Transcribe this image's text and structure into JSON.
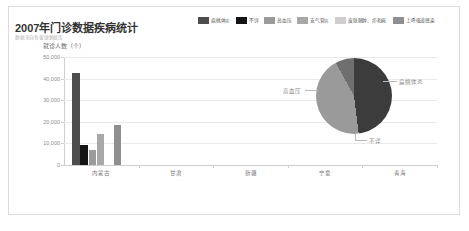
{
  "header": {
    "title": "2007年门诊数据疾病统计",
    "subtitle": "数据来自各省便数据库"
  },
  "legend": {
    "items": [
      {
        "label": "扁桃体炎",
        "color": "#4d4d4d"
      },
      {
        "label": "不详",
        "color": "#141414"
      },
      {
        "label": "高血压",
        "color": "#9b9b9b"
      },
      {
        "label": "支气管炎",
        "color": "#a8a8a8"
      },
      {
        "label": "皮肤脓肿、疖和痈",
        "color": "#cfcfcf"
      },
      {
        "label": "上呼吸道感染",
        "color": "#8f8f8f"
      }
    ]
  },
  "pie_labels": {
    "left": "高血压",
    "right": "扁桃体炎",
    "bottom": "不详"
  },
  "timeline": {
    "play_label": "play",
    "prev_label": "prev",
    "next_label": "next",
    "years": [
      "2007",
      "2008",
      "2009",
      "2010",
      "2011",
      "2012",
      "2013"
    ],
    "selected": "2007",
    "node_styles": [
      "dot",
      "ring",
      "ring",
      "ring",
      "ring",
      "diamond",
      "diamond"
    ]
  },
  "chart_data": [
    {
      "type": "bar",
      "title": "2007年门诊数据疾病统计",
      "subtitle": "数据来自各省便数据库",
      "xlabel": "",
      "ylabel": "就诊人数（个）",
      "ylim": [
        0,
        50000
      ],
      "yticks": [
        0,
        10000,
        20000,
        30000,
        40000,
        50000
      ],
      "ytick_labels": [
        "0",
        "10,000",
        "20,000",
        "30,000",
        "40,000",
        "50,000"
      ],
      "grid": true,
      "legend_position": "top-right",
      "categories": [
        "内蒙古",
        "甘肃",
        "新疆",
        "宁夏",
        "青海"
      ],
      "series": [
        {
          "name": "扁桃体炎",
          "color": "#4d4d4d",
          "values": [
            42500,
            0,
            0,
            0,
            0
          ]
        },
        {
          "name": "不详",
          "color": "#141414",
          "values": [
            9200,
            0,
            0,
            0,
            0
          ]
        },
        {
          "name": "高血压",
          "color": "#9b9b9b",
          "values": [
            7100,
            0,
            0,
            0,
            0
          ]
        },
        {
          "name": "支气管炎",
          "color": "#a8a8a8",
          "values": [
            14200,
            0,
            0,
            0,
            0
          ]
        },
        {
          "name": "皮肤脓肿、疖和痈",
          "color": "#cfcfcf",
          "values": [
            0,
            0,
            0,
            0,
            0
          ]
        },
        {
          "name": "上呼吸道感染",
          "color": "#8f8f8f",
          "values": [
            18600,
            0,
            0,
            0,
            0
          ]
        }
      ]
    },
    {
      "type": "pie",
      "labels": [
        "扁桃体炎",
        "高血压",
        "不详"
      ],
      "values": [
        48,
        44,
        8
      ],
      "colors": [
        "#3c3c3c",
        "#9a9a9a",
        "#6f6f6f"
      ],
      "legend_position": "callout"
    }
  ]
}
